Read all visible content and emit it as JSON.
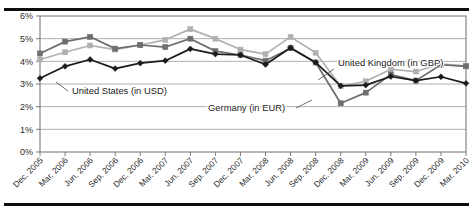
{
  "figure": {
    "top_rule": "",
    "bottom_rule": "",
    "title_fragment": ""
  },
  "chart_data": {
    "type": "line",
    "title": "",
    "xlabel": "",
    "ylabel": "",
    "ylim": [
      0,
      6
    ],
    "yticks": [
      0,
      1,
      2,
      3,
      4,
      5,
      6
    ],
    "ytick_labels": [
      "0%",
      "1%",
      "2%",
      "3%",
      "4%",
      "5%",
      "6%"
    ],
    "grid": true,
    "legend_position": "inline-annotations",
    "categories": [
      "Dec. 2005",
      "Mar. 2006",
      "Jun. 2006",
      "Sep. 2006",
      "Dec. 2006",
      "Mar. 2007",
      "Jun. 2007",
      "Sep. 2007",
      "Dec. 2007",
      "Mar. 2008",
      "Jun. 2008",
      "Sep. 2008",
      "Dec. 2008",
      "Mar. 2009",
      "Jun. 2009",
      "Sep. 2009",
      "Dec. 2009",
      "Mar. 2010"
    ],
    "series": [
      {
        "name": "United States (in USD)",
        "color": "#1b1b1b",
        "marker": "diamond",
        "values": [
          3.25,
          3.78,
          4.08,
          3.68,
          3.92,
          4.03,
          4.55,
          4.32,
          4.28,
          3.86,
          4.6,
          3.95,
          2.92,
          2.95,
          3.33,
          3.15,
          3.32,
          3.03
        ]
      },
      {
        "name": "United Kingdom (in GBP)",
        "color": "#b0b0b0",
        "marker": "square",
        "values": [
          4.08,
          4.4,
          4.7,
          4.52,
          4.72,
          4.95,
          5.42,
          5.0,
          4.52,
          4.32,
          5.08,
          4.38,
          2.9,
          3.12,
          3.65,
          3.55,
          3.88,
          3.8
        ]
      },
      {
        "name": "Germany (in EUR)",
        "color": "#6e6e6e",
        "marker": "square",
        "values": [
          4.35,
          4.87,
          5.08,
          4.56,
          4.72,
          4.63,
          5.0,
          4.45,
          4.28,
          4.03,
          4.58,
          3.95,
          2.15,
          2.62,
          3.42,
          3.15,
          3.85,
          3.78
        ]
      }
    ],
    "annotations": [
      {
        "text": "United States (in USD)",
        "series": "United States (in USD)"
      },
      {
        "text": "Germany (in EUR)",
        "series": "Germany (in EUR)"
      },
      {
        "text": "United Kingdom (in GBP)",
        "series": "United Kingdom (in GBP)"
      }
    ]
  }
}
